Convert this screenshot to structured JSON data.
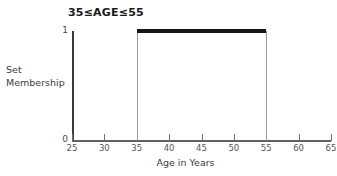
{
  "chart_data": {
    "type": "line",
    "title": "35≤AGE≤55",
    "xlabel": "Age in Years",
    "ylabel_lines": [
      "Set",
      "Membership"
    ],
    "xlim": [
      25,
      65
    ],
    "ylim": [
      0,
      1
    ],
    "grid": false,
    "legend": null,
    "xticks": [
      25,
      30,
      35,
      40,
      45,
      50,
      55,
      60,
      65
    ],
    "xtick_labels": [
      "25",
      "30",
      "35",
      "40",
      "45",
      "50",
      "55",
      "60",
      "65"
    ],
    "yticks": [
      0,
      1
    ],
    "ytick_labels": [
      "0",
      "1"
    ],
    "series": [
      {
        "name": "Set Membership",
        "x": [
          25,
          35,
          35,
          55,
          55,
          65
        ],
        "values": [
          0,
          0,
          1,
          1,
          0,
          0
        ]
      }
    ],
    "annotations": {
      "plateau_start": 35,
      "plateau_end": 55,
      "plateau_value": 1
    },
    "colors": {
      "plateau": "#151515",
      "riser": "#9a9a9a",
      "axis": "#3a3a3a",
      "x_axis": "#606060",
      "background": "#ffffff",
      "text": "#3c3c3c"
    }
  }
}
